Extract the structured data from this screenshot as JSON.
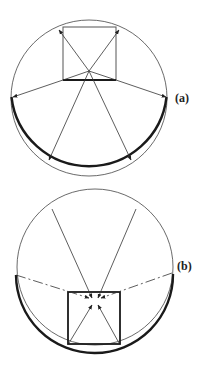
{
  "figure": {
    "panels": [
      {
        "id": "a",
        "label": "(a)",
        "description": "Rays emitted outward from the bottom edge of a square to the lower circular boundary"
      },
      {
        "id": "b",
        "label": "(b)",
        "description": "Rays converging inward from the circle boundary toward a point inside the square"
      }
    ],
    "colors": {
      "line": "#333333",
      "thick": "#1a1a1a",
      "background": "#ffffff"
    }
  }
}
